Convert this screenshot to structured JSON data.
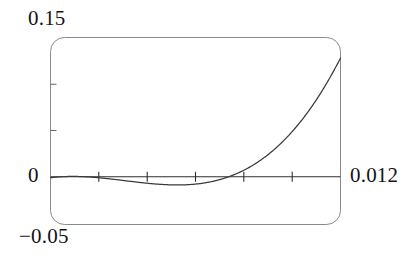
{
  "chart_data": {
    "type": "line",
    "title": "",
    "xlabel": "",
    "ylabel": "",
    "xlim": [
      0,
      0.012
    ],
    "ylim": [
      -0.05,
      0.15
    ],
    "grid": false,
    "legend": null,
    "frame": "rounded-rectangle",
    "axis_line": "horizontal at y = 0",
    "x_ticks": [
      0.002,
      0.004,
      0.006,
      0.008,
      0.01
    ],
    "y_ticks": [
      0.05,
      0.1
    ],
    "x_tick_labels": [],
    "y_tick_labels": [],
    "series": [
      {
        "name": "curve",
        "x": [
          0.0,
          0.0005,
          0.001,
          0.0015,
          0.002,
          0.0025,
          0.003,
          0.0035,
          0.004,
          0.0045,
          0.005,
          0.0055,
          0.006,
          0.0065,
          0.007,
          0.0075,
          0.008,
          0.0085,
          0.009,
          0.0095,
          0.01,
          0.0105,
          0.011,
          0.0115,
          0.012
        ],
        "y": [
          0.0,
          -0.0013,
          -0.0026,
          -0.0038,
          -0.0048,
          -0.0057,
          -0.0064,
          -0.007,
          -0.0074,
          -0.0076,
          -0.0076,
          -0.0073,
          -0.0068,
          -0.006,
          -0.0048,
          -0.0032,
          -0.0011,
          0.0016,
          0.005,
          0.0092,
          0.0144,
          0.0207,
          0.0283,
          0.0374,
          0.0482
        ],
        "minimum_x": 0.00525,
        "minimum_y": -0.0077,
        "zero_crossing_x": 0.00805,
        "endpoint_y": 0.128
      }
    ],
    "annotations": [
      {
        "name": "ymax",
        "text": "0.15",
        "position": "top-left-outside"
      },
      {
        "name": "ymin",
        "text": "−0.05",
        "position": "bottom-left-outside"
      },
      {
        "name": "origin",
        "text": "0",
        "position": "left-of-axis"
      },
      {
        "name": "xmax",
        "text": "0.012",
        "position": "right-of-axis"
      }
    ]
  },
  "labels": {
    "y_max": "0.15",
    "y_min": "−0.05",
    "origin": "0",
    "x_max": "0.012"
  },
  "colors": {
    "frame": "#8a8a8a",
    "axis": "#2e2e2e",
    "curve": "#3a3a3a",
    "tick": "#6e6e6e",
    "background": "#ffffff",
    "text": "#141414"
  }
}
